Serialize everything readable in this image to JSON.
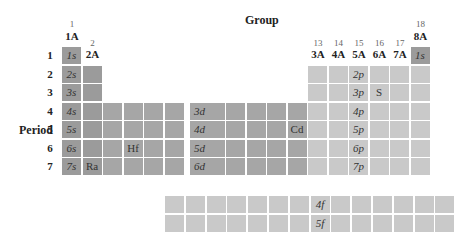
{
  "title": "Group",
  "period_label": "Period",
  "group_numbers": [
    "1",
    "2",
    "3",
    "4",
    "5",
    "6",
    "7",
    "8",
    "9",
    "10",
    "11",
    "12",
    "13",
    "14",
    "15",
    "16",
    "17",
    "18"
  ],
  "group_labels": {
    "1": "1A",
    "2": "2A",
    "13": "3A",
    "14": "4A",
    "15": "5A",
    "16": "6A",
    "17": "7A",
    "18": "8A"
  },
  "periods": [
    "1",
    "2",
    "3",
    "4",
    "5",
    "6",
    "7"
  ],
  "s_labels": [
    "1s",
    "2s",
    "3s",
    "4s",
    "5s",
    "6s",
    "7s"
  ],
  "he_label": "1s",
  "d_labels": [
    "3d",
    "4d",
    "5d",
    "6d"
  ],
  "p_labels": [
    "2p",
    "3p",
    "4p",
    "5p",
    "6p",
    "7p"
  ],
  "f_labels": [
    "4f",
    "5f"
  ],
  "elements": {
    "S": "S",
    "Hf": "Hf",
    "Cd": "Cd",
    "Ra": "Ra"
  },
  "colors": {
    "s_block": "#9b9b9b",
    "d_block": "#a6a6a6",
    "p_block": "#c9c9c9",
    "f_block": "#c9c9c9"
  }
}
